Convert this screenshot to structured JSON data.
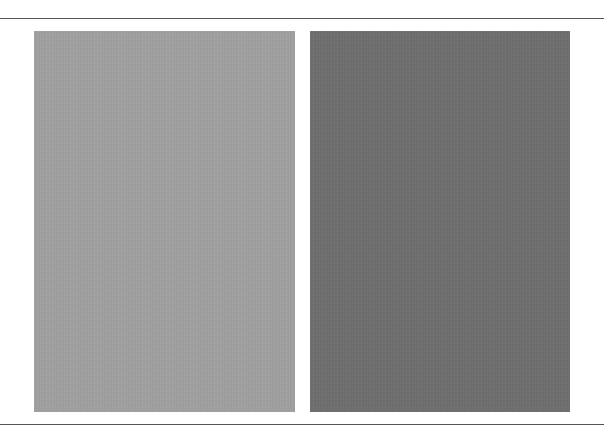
{
  "figure": {
    "rules": {
      "top_y": 18,
      "bottom_y": 424,
      "color": "#555555"
    },
    "panels": [
      {
        "name": "light-gray-swatch",
        "color": "#a1a1a1",
        "x": 34,
        "y": 31,
        "width": 261,
        "height": 381
      },
      {
        "name": "dark-gray-swatch",
        "color": "#6f6f6f",
        "x": 310,
        "y": 31,
        "width": 260,
        "height": 381
      }
    ]
  }
}
